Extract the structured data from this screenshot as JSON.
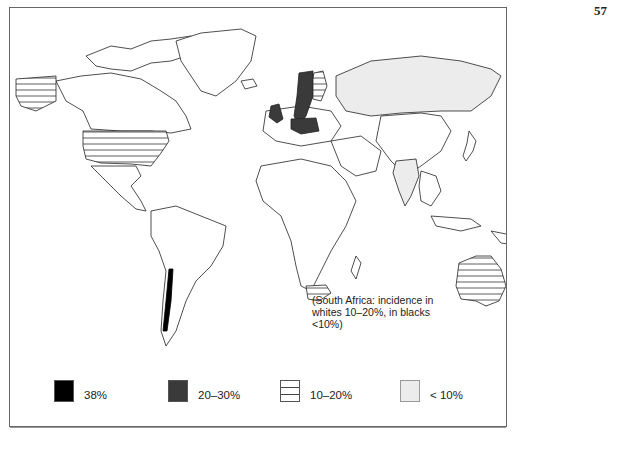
{
  "page": {
    "number": "57"
  },
  "map": {
    "title": "",
    "type": "world choropleth",
    "annotation": "(South Africa: incidence in whites 10–20%, in blacks <10%)",
    "categories": [
      {
        "key": "very_high",
        "label": "38%",
        "pattern": "solid-black",
        "color": "#000000",
        "regions": [
          "Chile"
        ]
      },
      {
        "key": "high",
        "label": "20–30%",
        "pattern": "dark-stipple",
        "color": "#3a3a3a",
        "regions": [
          "United Kingdom",
          "Ireland",
          "Sweden",
          "Norway",
          "Denmark",
          "Poland",
          "Germany (east)"
        ]
      },
      {
        "key": "medium",
        "label": "10–20%",
        "pattern": "horizontal-lines",
        "color": "#ffffff",
        "regions": [
          "Alaska",
          "United States",
          "Australia",
          "Finland",
          "South Africa (whites)"
        ]
      },
      {
        "key": "low",
        "label": "< 10%",
        "pattern": "light-gray",
        "color": "#ececec",
        "regions": [
          "Russia / Siberia",
          "India",
          "Myanmar",
          "South Africa (blacks)"
        ]
      }
    ]
  },
  "legend": {
    "items": [
      {
        "label": "38%",
        "color": "#000000"
      },
      {
        "label": "20–30%",
        "color": "#3a3a3a"
      },
      {
        "label": "10–20%",
        "color": "#ffffff"
      },
      {
        "label": "< 10%",
        "color": "#ececec"
      }
    ]
  }
}
